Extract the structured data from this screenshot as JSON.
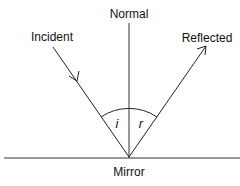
{
  "diagram": {
    "labels": {
      "normal": "Normal",
      "incident": "Incident",
      "reflected": "Reflected",
      "mirror": "Mirror",
      "angle_incidence": "i",
      "angle_reflection": "r"
    },
    "colors": {
      "line": "#222222",
      "background": "#ffffff"
    }
  }
}
